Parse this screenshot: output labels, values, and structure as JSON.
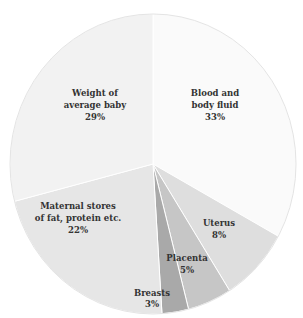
{
  "chart_data": {
    "type": "pie",
    "title": "",
    "start_angle": "12 o'clock",
    "direction": "clockwise",
    "slices": [
      {
        "label": "Blood and body fluid",
        "label_lines": [
          "Blood and",
          "body fluid"
        ],
        "value": 33,
        "display": "33%",
        "color": "#fafafa"
      },
      {
        "label": "Uterus",
        "label_lines": [
          "Uterus"
        ],
        "value": 8,
        "display": "8%",
        "color": "#dedede"
      },
      {
        "label": "Placenta",
        "label_lines": [
          "Placenta"
        ],
        "value": 5,
        "display": "5%",
        "color": "#c6c6c6"
      },
      {
        "label": "Breasts",
        "label_lines": [
          "Breasts"
        ],
        "value": 3,
        "display": "3%",
        "color": "#a9a9a9"
      },
      {
        "label": "Maternal stores of fat, protein etc.",
        "label_lines": [
          "Maternal stores",
          "of fat, protein etc."
        ],
        "value": 22,
        "display": "22%",
        "color": "#e6e6e6"
      },
      {
        "label": "Weight of average baby",
        "label_lines": [
          "Weight of",
          "average baby"
        ],
        "value": 29,
        "display": "29%",
        "color": "#f2f2f2"
      }
    ],
    "categories": [
      "Blood and body fluid",
      "Uterus",
      "Placenta",
      "Breasts",
      "Maternal stores of fat, protein etc.",
      "Weight of average baby"
    ],
    "values": [
      33,
      8,
      5,
      3,
      22,
      29
    ],
    "unit": "%"
  },
  "labels": {
    "blood": {
      "line1": "Blood and",
      "line2": "body fluid",
      "pct": "33%"
    },
    "uterus": {
      "line1": "Uterus",
      "pct": "8%"
    },
    "placenta": {
      "line1": "Placenta",
      "pct": "5%"
    },
    "breasts": {
      "line1": "Breasts",
      "pct": "3%"
    },
    "maternal": {
      "line1": "Maternal stores",
      "line2": "of fat, protein etc.",
      "pct": "22%"
    },
    "baby": {
      "line1": "Weight of",
      "line2": "average baby",
      "pct": "29%"
    }
  }
}
